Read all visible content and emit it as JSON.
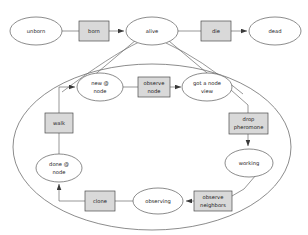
{
  "diagram": {
    "type": "state-machine",
    "colors": {
      "background": "#ffffff",
      "state_fill": "#ffffff",
      "action_fill": "#d9d9d9",
      "stroke": "#5a5a5a",
      "text": "#1a1a1a"
    },
    "top_level": {
      "states": [
        {
          "id": "unborn",
          "label": "unborn",
          "shape": "ellipse",
          "cx": 36,
          "cy": 31,
          "rx": 26,
          "ry": 14
        },
        {
          "id": "alive",
          "label": "alive",
          "shape": "ellipse",
          "cx": 152,
          "cy": 31,
          "rx": 26,
          "ry": 14
        },
        {
          "id": "dead",
          "label": "dead",
          "shape": "ellipse",
          "cx": 275,
          "cy": 31,
          "rx": 26,
          "ry": 14
        }
      ],
      "actions": [
        {
          "id": "born",
          "label": "born",
          "shape": "box",
          "x": 79,
          "y": 21,
          "w": 30,
          "h": 20
        },
        {
          "id": "die",
          "label": "die",
          "shape": "box",
          "x": 201,
          "y": 21,
          "w": 30,
          "h": 20
        }
      ],
      "edges": [
        {
          "from": "unborn",
          "to": "born",
          "arrow": false
        },
        {
          "from": "born",
          "to": "alive",
          "arrow": true
        },
        {
          "from": "alive",
          "to": "die",
          "arrow": false
        },
        {
          "from": "die",
          "to": "dead",
          "arrow": true
        }
      ]
    },
    "composite": {
      "owner": "alive",
      "label": "",
      "outline": {
        "cx": 152,
        "cy": 147,
        "rx": 139,
        "ry": 83
      },
      "states": [
        {
          "id": "new-at-node",
          "label_lines": [
            "new @",
            "node"
          ],
          "shape": "ellipse",
          "cx": 100,
          "cy": 87,
          "rx": 23,
          "ry": 14
        },
        {
          "id": "got-a-node-view",
          "label_lines": [
            "got a node",
            "view"
          ],
          "shape": "ellipse",
          "cx": 207,
          "cy": 87,
          "rx": 25,
          "ry": 14
        },
        {
          "id": "working",
          "label_lines": [
            "working"
          ],
          "shape": "ellipse",
          "cx": 249,
          "cy": 163,
          "rx": 24,
          "ry": 14
        },
        {
          "id": "observing",
          "label_lines": [
            "observing"
          ],
          "shape": "ellipse",
          "cx": 158,
          "cy": 201,
          "rx": 25,
          "ry": 13
        },
        {
          "id": "done-at-node",
          "label_lines": [
            "done @",
            "node"
          ],
          "shape": "ellipse",
          "cx": 59,
          "cy": 168,
          "rx": 23,
          "ry": 14
        }
      ],
      "actions": [
        {
          "id": "observe-node",
          "label_lines": [
            "observe",
            "node"
          ],
          "shape": "box",
          "x": 138,
          "y": 77,
          "w": 32,
          "h": 20
        },
        {
          "id": "drop-pheromone",
          "label_lines": [
            "drop",
            "pheromone"
          ],
          "shape": "box",
          "x": 229,
          "y": 113,
          "w": 39,
          "h": 21
        },
        {
          "id": "observe-neighbors",
          "label_lines": [
            "observe",
            "neighbors"
          ],
          "shape": "box",
          "x": 194,
          "y": 191,
          "w": 38,
          "h": 20
        },
        {
          "id": "clone",
          "label_lines": [
            "clone"
          ],
          "shape": "box",
          "x": 85,
          "y": 191,
          "w": 30,
          "h": 20
        },
        {
          "id": "walk",
          "label_lines": [
            "walk"
          ],
          "shape": "box",
          "x": 45,
          "y": 113,
          "w": 28,
          "h": 20
        }
      ],
      "edges": [
        {
          "from": "new-at-node",
          "to": "observe-node",
          "arrow": false
        },
        {
          "from": "observe-node",
          "to": "got-a-node-view",
          "arrow": true
        },
        {
          "from": "got-a-node-view",
          "to": "drop-pheromone",
          "arrow": false
        },
        {
          "from": "drop-pheromone",
          "to": "working",
          "arrow": true
        },
        {
          "from": "working",
          "to": "observe-neighbors",
          "arrow": false
        },
        {
          "from": "observe-neighbors",
          "to": "observing",
          "arrow": true
        },
        {
          "from": "observing",
          "to": "clone",
          "arrow": false
        },
        {
          "from": "clone",
          "to": "done-at-node",
          "arrow": true
        },
        {
          "from": "done-at-node",
          "to": "walk",
          "arrow": false
        },
        {
          "from": "walk",
          "to": "new-at-node",
          "arrow": true
        }
      ]
    }
  }
}
